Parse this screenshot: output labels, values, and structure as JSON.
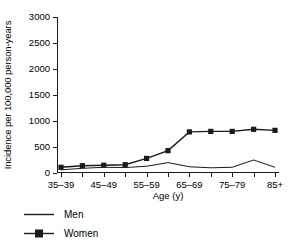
{
  "chart_data": {
    "type": "line",
    "title": "",
    "xlabel": "Age (y)",
    "ylabel": "Incidence per 100,000 person-years",
    "categories": [
      "35-39",
      "40-44",
      "45-49",
      "50-54",
      "55-59",
      "60-64",
      "65-69",
      "70-74",
      "75-79",
      "80-84",
      "85+"
    ],
    "tick_labels": [
      "35–39",
      "",
      "45–49",
      "",
      "55–59",
      "",
      "65–69",
      "",
      "75–79",
      "",
      "85+"
    ],
    "visible_tick_labels": [
      "35–39",
      "45–49",
      "55–59",
      "65–69",
      "75–79",
      "85+"
    ],
    "ylim": [
      0,
      3000
    ],
    "yticks": [
      0,
      500,
      1000,
      1500,
      2000,
      2500,
      3000
    ],
    "ytick_labels": [
      "0",
      "500",
      "1000",
      "1500",
      "2000",
      "2500",
      "3000"
    ],
    "grid": false,
    "legend_position": "below-left",
    "series": [
      {
        "name": "Men",
        "marker": "none",
        "color": "#1a1a1a",
        "values": [
          60,
          90,
          110,
          105,
          130,
          200,
          120,
          100,
          110,
          250,
          110
        ]
      },
      {
        "name": "Women",
        "marker": "square",
        "color": "#1a1a1a",
        "values": [
          110,
          140,
          150,
          160,
          280,
          430,
          790,
          800,
          800,
          840,
          820
        ]
      }
    ]
  },
  "legend": {
    "entries": [
      {
        "label": "Men",
        "key": "line"
      },
      {
        "label": "Women",
        "key": "line-square-marker"
      }
    ]
  }
}
